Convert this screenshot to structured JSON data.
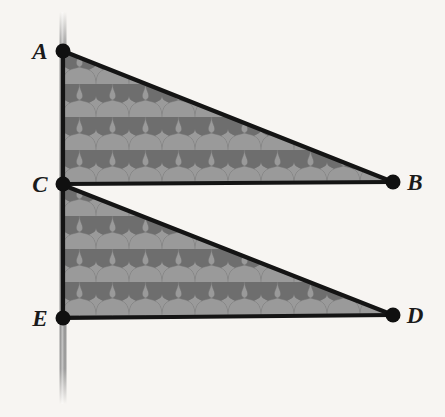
{
  "figure": {
    "background_color": "#f7f5f2",
    "line_color": "#1a1a1a",
    "fill_color": "#969696",
    "fill_pattern_dark": "#6e6e6e",
    "pole_color": "#8f8f8f",
    "points": [
      {
        "id": "A",
        "label": "A",
        "x": 63,
        "y": 51,
        "label_x": 36,
        "label_y": 58,
        "dot_radius": 7
      },
      {
        "id": "B",
        "label": "B",
        "x": 393,
        "y": 182,
        "label_x": 406,
        "label_y": 190,
        "dot_radius": 7
      },
      {
        "id": "C",
        "label": "C",
        "x": 63,
        "y": 184,
        "label_x": 36,
        "label_y": 192,
        "dot_radius": 7
      },
      {
        "id": "D",
        "label": "D",
        "x": 393,
        "y": 315,
        "label_x": 406,
        "label_y": 323,
        "dot_radius": 7
      },
      {
        "id": "E",
        "label": "E",
        "x": 63,
        "y": 318,
        "label_x": 36,
        "label_y": 326,
        "dot_radius": 7
      }
    ],
    "triangles": [
      {
        "id": "ACB",
        "name": "upper-triangle",
        "vertices": "A,C,B",
        "path": "M 63 51 L 393 182 L 63 184 Z"
      },
      {
        "id": "CED",
        "name": "lower-triangle",
        "vertices": "C,E,D",
        "path": "M 63 186 L 393 315 L 63 318 Z"
      }
    ],
    "segments": [
      {
        "id": "AB",
        "name": "segment-a-b",
        "x1": 63,
        "y1": 51,
        "x2": 393,
        "y2": 182
      },
      {
        "id": "CB",
        "name": "segment-c-b",
        "x1": 63,
        "y1": 184,
        "x2": 393,
        "y2": 182
      },
      {
        "id": "CD",
        "name": "segment-c-d",
        "x1": 63,
        "y1": 185,
        "x2": 393,
        "y2": 315
      },
      {
        "id": "ED",
        "name": "segment-e-d",
        "x1": 63,
        "y1": 318,
        "x2": 393,
        "y2": 315
      },
      {
        "id": "AE",
        "name": "segment-a-e-vertical",
        "x1": 63,
        "y1": 51,
        "x2": 63,
        "y2": 318
      }
    ],
    "pole": {
      "name": "vertical-line",
      "x": 63,
      "y_top": 12,
      "y_bottom": 404,
      "width": 7
    },
    "pattern": {
      "name": "interlocking-tile-texture",
      "tile_width": 33,
      "tile_height": 33,
      "description": "repeating interlocking mushroom/T shapes"
    }
  }
}
